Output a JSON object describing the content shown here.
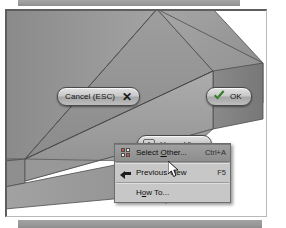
{
  "app": {
    "canvas_label": "3d-model-viewport",
    "model_name": "channel-bracket-solid",
    "model_fill_top": "#9a9a9a",
    "model_fill_inner": "#8c8c8c",
    "model_fill_front": "#a5a5a5",
    "model_fill_side": "#7e7e7e",
    "background": "#ffffff"
  },
  "hud": {
    "cancel": {
      "label": "Cancel (ESC)",
      "icon": "close-x-icon",
      "glyph": "✕"
    },
    "ok": {
      "label": "OK",
      "icon": "checkmark-icon",
      "accent": "#2e7d1e"
    },
    "home_view": {
      "label": "Home View",
      "icon": "home-icon"
    }
  },
  "context_menu": {
    "items": [
      {
        "label": "Select Other...",
        "label_pre": "Select ",
        "label_key": "O",
        "label_post": "ther...",
        "shortcut": "Ctrl+A",
        "icon": "select-other-grid-icon",
        "highlighted": true
      },
      {
        "label": "Previous View",
        "label_pre": "Previous View",
        "label_key": "",
        "label_post": "",
        "shortcut": "F5",
        "icon": "previous-view-back-arrow-icon",
        "highlighted": false
      },
      {
        "label": "How To...",
        "label_pre": "H",
        "label_key": "o",
        "label_post": "w To...",
        "shortcut": "",
        "icon": "",
        "highlighted": false
      }
    ]
  },
  "cursor": {
    "name": "arrow-pointer",
    "x": 161,
    "y": 150
  }
}
